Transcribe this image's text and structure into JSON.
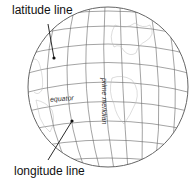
{
  "diagram": {
    "labels": {
      "latitude": "latitude line",
      "longitude": "longitude line",
      "equator": "equator",
      "prime_meridian": "prime meridian"
    },
    "colors": {
      "grid": "#555555",
      "coast": "#aaaaaa",
      "pointer": "#111111"
    }
  }
}
